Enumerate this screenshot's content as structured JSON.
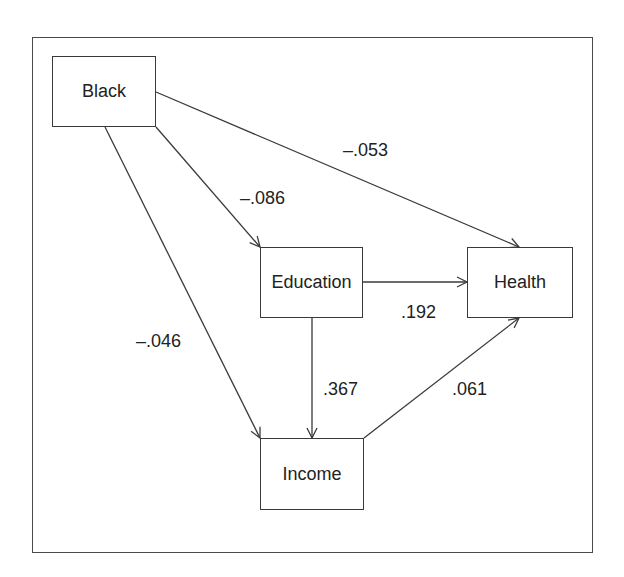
{
  "diagram": {
    "type": "path-diagram",
    "nodes": [
      {
        "id": "black",
        "label": "Black"
      },
      {
        "id": "education",
        "label": "Education"
      },
      {
        "id": "health",
        "label": "Health"
      },
      {
        "id": "income",
        "label": "Income"
      }
    ],
    "edges": [
      {
        "from": "Black",
        "to": "Health",
        "coefficient": "–.053"
      },
      {
        "from": "Black",
        "to": "Education",
        "coefficient": "–.086"
      },
      {
        "from": "Black",
        "to": "Income",
        "coefficient": "–.046"
      },
      {
        "from": "Education",
        "to": "Health",
        "coefficient": ".192"
      },
      {
        "from": "Education",
        "to": "Income",
        "coefficient": ".367"
      },
      {
        "from": "Income",
        "to": "Health",
        "coefficient": ".061"
      }
    ],
    "colors": {
      "line": "#3a3a3a",
      "text": "#222222",
      "background": "#ffffff"
    }
  }
}
